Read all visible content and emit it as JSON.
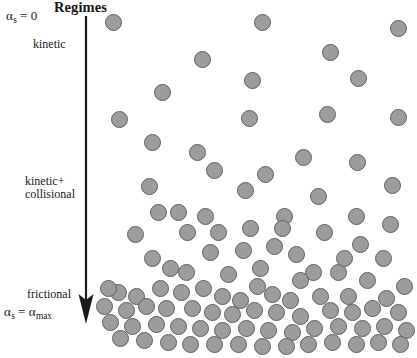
{
  "figure": {
    "title": "Regimes",
    "width": 417,
    "height": 358,
    "background_color": "#ffffff"
  },
  "labels": {
    "alpha_top": "α",
    "alpha_top_sub": "s",
    "alpha_top_value": "= 0",
    "kinetic": "kinetic",
    "kinetic_collisional_line1": "kinetic+",
    "kinetic_collisional_line2": "collisional",
    "frictional": "frictional",
    "alpha_bottom": "α",
    "alpha_bottom_sub": "s",
    "alpha_bottom_eq": "=",
    "alpha_bottom_value": "α",
    "alpha_bottom_value_sub": "max"
  },
  "arrow": {
    "name": "downward-gradient-arrow",
    "direction": "down",
    "color": "#1a1a1a",
    "x": 16,
    "y_start": 6,
    "y_end": 312
  },
  "chart_data": {
    "type": "scatter",
    "title": "Regimes",
    "xlabel": "",
    "ylabel": "",
    "xlim": [
      95,
      417
    ],
    "ylim": [
      0,
      358
    ],
    "grid": false,
    "legend": "none",
    "annotations": [
      {
        "text": "Regimes",
        "role": "title",
        "x": 54,
        "y": 0
      },
      {
        "text": "αs = 0",
        "role": "axis-endpoint-top",
        "x": 6,
        "y": 9
      },
      {
        "text": "kinetic",
        "role": "regime-label",
        "x": 33,
        "y": 38
      },
      {
        "text": "kinetic+ collisional",
        "role": "regime-label",
        "x": 25,
        "y": 175
      },
      {
        "text": "frictional",
        "role": "regime-label",
        "x": 27,
        "y": 288
      },
      {
        "text": "αs = αmax",
        "role": "axis-endpoint-bottom",
        "x": 4,
        "y": 305
      }
    ],
    "particle_style": {
      "fill": "#9c9c9c",
      "stroke": "#606060",
      "shape": "circle",
      "diameter_px": 17
    },
    "particles": [
      {
        "x": 113,
        "y": 22,
        "d": 17
      },
      {
        "x": 262,
        "y": 22,
        "d": 17
      },
      {
        "x": 398,
        "y": 28,
        "d": 17
      },
      {
        "x": 202,
        "y": 59,
        "d": 17
      },
      {
        "x": 330,
        "y": 52,
        "d": 17
      },
      {
        "x": 358,
        "y": 78,
        "d": 17
      },
      {
        "x": 252,
        "y": 80,
        "d": 17
      },
      {
        "x": 162,
        "y": 92,
        "d": 17
      },
      {
        "x": 119,
        "y": 119,
        "d": 17
      },
      {
        "x": 249,
        "y": 118,
        "d": 17
      },
      {
        "x": 327,
        "y": 114,
        "d": 17
      },
      {
        "x": 398,
        "y": 117,
        "d": 17
      },
      {
        "x": 152,
        "y": 142,
        "d": 17
      },
      {
        "x": 197,
        "y": 152,
        "d": 17
      },
      {
        "x": 303,
        "y": 157,
        "d": 17
      },
      {
        "x": 357,
        "y": 162,
        "d": 17
      },
      {
        "x": 214,
        "y": 170,
        "d": 17
      },
      {
        "x": 265,
        "y": 174,
        "d": 17
      },
      {
        "x": 149,
        "y": 186,
        "d": 17
      },
      {
        "x": 392,
        "y": 185,
        "d": 17
      },
      {
        "x": 245,
        "y": 190,
        "d": 17
      },
      {
        "x": 318,
        "y": 196,
        "d": 17
      },
      {
        "x": 178,
        "y": 212,
        "d": 17
      },
      {
        "x": 205,
        "y": 216,
        "d": 17
      },
      {
        "x": 284,
        "y": 216,
        "d": 17
      },
      {
        "x": 356,
        "y": 216,
        "d": 17
      },
      {
        "x": 390,
        "y": 224,
        "d": 17
      },
      {
        "x": 135,
        "y": 234,
        "d": 17
      },
      {
        "x": 187,
        "y": 232,
        "d": 17
      },
      {
        "x": 218,
        "y": 232,
        "d": 17
      },
      {
        "x": 250,
        "y": 228,
        "d": 17
      },
      {
        "x": 282,
        "y": 228,
        "d": 17
      },
      {
        "x": 324,
        "y": 232,
        "d": 17
      },
      {
        "x": 360,
        "y": 244,
        "d": 17
      },
      {
        "x": 152,
        "y": 258,
        "d": 17
      },
      {
        "x": 210,
        "y": 252,
        "d": 17
      },
      {
        "x": 243,
        "y": 250,
        "d": 17
      },
      {
        "x": 296,
        "y": 254,
        "d": 17
      },
      {
        "x": 383,
        "y": 258,
        "d": 17
      },
      {
        "x": 170,
        "y": 268,
        "d": 17
      },
      {
        "x": 186,
        "y": 272,
        "d": 17
      },
      {
        "x": 228,
        "y": 274,
        "d": 17
      },
      {
        "x": 260,
        "y": 268,
        "d": 17
      },
      {
        "x": 313,
        "y": 272,
        "d": 17
      },
      {
        "x": 338,
        "y": 272,
        "d": 17
      },
      {
        "x": 203,
        "y": 288,
        "d": 17
      },
      {
        "x": 257,
        "y": 286,
        "d": 17
      },
      {
        "x": 300,
        "y": 280,
        "d": 17
      },
      {
        "x": 367,
        "y": 280,
        "d": 17
      },
      {
        "x": 404,
        "y": 286,
        "d": 17
      },
      {
        "x": 118,
        "y": 292,
        "d": 17
      },
      {
        "x": 136,
        "y": 296,
        "d": 17
      },
      {
        "x": 160,
        "y": 288,
        "d": 17
      },
      {
        "x": 181,
        "y": 292,
        "d": 17
      },
      {
        "x": 222,
        "y": 296,
        "d": 17
      },
      {
        "x": 240,
        "y": 300,
        "d": 17
      },
      {
        "x": 272,
        "y": 294,
        "d": 17
      },
      {
        "x": 290,
        "y": 300,
        "d": 17
      },
      {
        "x": 320,
        "y": 296,
        "d": 17
      },
      {
        "x": 348,
        "y": 296,
        "d": 17
      },
      {
        "x": 386,
        "y": 298,
        "d": 17
      },
      {
        "x": 104,
        "y": 306,
        "d": 17
      },
      {
        "x": 126,
        "y": 310,
        "d": 17
      },
      {
        "x": 146,
        "y": 306,
        "d": 17
      },
      {
        "x": 166,
        "y": 308,
        "d": 17
      },
      {
        "x": 192,
        "y": 308,
        "d": 17
      },
      {
        "x": 212,
        "y": 312,
        "d": 17
      },
      {
        "x": 232,
        "y": 314,
        "d": 17
      },
      {
        "x": 254,
        "y": 310,
        "d": 17
      },
      {
        "x": 276,
        "y": 312,
        "d": 17
      },
      {
        "x": 300,
        "y": 316,
        "d": 17
      },
      {
        "x": 330,
        "y": 310,
        "d": 17
      },
      {
        "x": 352,
        "y": 312,
        "d": 17
      },
      {
        "x": 372,
        "y": 308,
        "d": 17
      },
      {
        "x": 398,
        "y": 312,
        "d": 17
      },
      {
        "x": 110,
        "y": 322,
        "d": 17
      },
      {
        "x": 132,
        "y": 326,
        "d": 17
      },
      {
        "x": 156,
        "y": 324,
        "d": 17
      },
      {
        "x": 178,
        "y": 326,
        "d": 17
      },
      {
        "x": 200,
        "y": 328,
        "d": 17
      },
      {
        "x": 222,
        "y": 330,
        "d": 17
      },
      {
        "x": 246,
        "y": 328,
        "d": 17
      },
      {
        "x": 268,
        "y": 330,
        "d": 17
      },
      {
        "x": 292,
        "y": 332,
        "d": 17
      },
      {
        "x": 314,
        "y": 328,
        "d": 17
      },
      {
        "x": 338,
        "y": 326,
        "d": 17
      },
      {
        "x": 362,
        "y": 328,
        "d": 17
      },
      {
        "x": 384,
        "y": 326,
        "d": 17
      },
      {
        "x": 406,
        "y": 330,
        "d": 17
      },
      {
        "x": 120,
        "y": 338,
        "d": 17
      },
      {
        "x": 144,
        "y": 340,
        "d": 17
      },
      {
        "x": 168,
        "y": 342,
        "d": 17
      },
      {
        "x": 190,
        "y": 344,
        "d": 17
      },
      {
        "x": 214,
        "y": 344,
        "d": 17
      },
      {
        "x": 238,
        "y": 344,
        "d": 17
      },
      {
        "x": 262,
        "y": 346,
        "d": 17
      },
      {
        "x": 286,
        "y": 346,
        "d": 17
      },
      {
        "x": 308,
        "y": 344,
        "d": 17
      },
      {
        "x": 332,
        "y": 342,
        "d": 17
      },
      {
        "x": 356,
        "y": 344,
        "d": 17
      },
      {
        "x": 378,
        "y": 342,
        "d": 17
      },
      {
        "x": 400,
        "y": 344,
        "d": 17
      },
      {
        "x": 108,
        "y": 288,
        "d": 17
      },
      {
        "x": 344,
        "y": 258,
        "d": 17
      },
      {
        "x": 274,
        "y": 246,
        "d": 17
      },
      {
        "x": 158,
        "y": 212,
        "d": 17
      }
    ]
  }
}
